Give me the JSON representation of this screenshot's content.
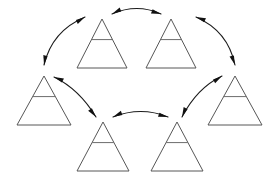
{
  "diagram": {
    "background_color": "#ffffff",
    "node_stroke_color": "#575757",
    "node_crossbar_color": "#6d6d6d",
    "arrow_color": "#1c1c1c",
    "node_count": 6,
    "arrow_count": 6,
    "arrow_style": "double-headed-curved",
    "nodes": [
      {
        "id": "triangle-top-left",
        "label": "",
        "apex_x": 102,
        "apex_y": 19,
        "base_left_x": 77,
        "base_right_x": 127,
        "base_y": 68,
        "crossbar_ratio": 0.42
      },
      {
        "id": "triangle-top-right",
        "label": "",
        "apex_x": 171,
        "apex_y": 19,
        "base_left_x": 146,
        "base_right_x": 196,
        "base_y": 68,
        "crossbar_ratio": 0.42
      },
      {
        "id": "triangle-right",
        "label": "",
        "apex_x": 235,
        "apex_y": 76,
        "base_left_x": 208,
        "base_right_x": 262,
        "base_y": 125,
        "crossbar_ratio": 0.42
      },
      {
        "id": "triangle-bottom-right",
        "label": "",
        "apex_x": 177,
        "apex_y": 122,
        "base_left_x": 151,
        "base_right_x": 203,
        "base_y": 171,
        "crossbar_ratio": 0.42
      },
      {
        "id": "triangle-bottom-left",
        "label": "",
        "apex_x": 103,
        "apex_y": 122,
        "base_left_x": 77,
        "base_right_x": 129,
        "base_y": 171,
        "crossbar_ratio": 0.42
      },
      {
        "id": "triangle-left",
        "label": "",
        "apex_x": 44,
        "apex_y": 76,
        "base_left_x": 17,
        "base_right_x": 71,
        "base_y": 125,
        "crossbar_ratio": 0.42
      }
    ],
    "arrows": [
      {
        "id": "arrow-top-left-to-top-right",
        "from": "triangle-top-left",
        "to": "triangle-top-right",
        "double_headed": true,
        "path": "M 112 14 Q 137 3 161 14"
      },
      {
        "id": "arrow-top-right-to-right",
        "from": "triangle-top-right",
        "to": "triangle-right",
        "double_headed": true,
        "path": "M 196 17 Q 228 31 235 65"
      },
      {
        "id": "arrow-right-to-bottom-right",
        "from": "triangle-right",
        "to": "triangle-bottom-right",
        "double_headed": true,
        "path": "M 222 76 Q 197 88 182 117"
      },
      {
        "id": "arrow-bottom-right-to-bottom-left",
        "from": "triangle-bottom-right",
        "to": "triangle-bottom-left",
        "double_headed": true,
        "path": "M 168 117 Q 141 106 113 117"
      },
      {
        "id": "arrow-bottom-left-to-left",
        "from": "triangle-bottom-left",
        "to": "triangle-left",
        "double_headed": true,
        "path": "M 96 117 Q 79 89 54 77"
      },
      {
        "id": "arrow-left-to-top-left",
        "from": "triangle-left",
        "to": "triangle-top-left",
        "double_headed": true,
        "path": "M 44 65 Q 52 31 85 17"
      }
    ]
  }
}
